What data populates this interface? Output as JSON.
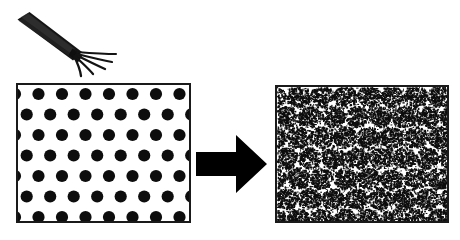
{
  "figure": {
    "background_color": "#ffffff",
    "width": 460,
    "height": 240
  },
  "tool": {
    "name": "rake-tool",
    "label": "mixing rake",
    "color": "#141414",
    "handle": {
      "angle_deg": 33,
      "length": 62,
      "thickness": 9
    },
    "tines": {
      "count": 5,
      "length": 42,
      "spread_deg": [
        12,
        26,
        40,
        54,
        68
      ]
    }
  },
  "arrow": {
    "name": "process-arrow",
    "direction": "right",
    "color": "#000000",
    "label": ""
  },
  "panels": [
    {
      "id": "ordered",
      "name": "ordered-particle-panel",
      "caption": "",
      "border_color": "#1a1a1a",
      "background_color": "#ffffff",
      "dot_color": "#0d0d0d",
      "pattern": "staggered-grid",
      "rows": 7,
      "cols": 8,
      "dot_radius": 6.1,
      "row_spacing": 20.5,
      "col_spacing": 23.5,
      "row_offset": 11.7,
      "first_row_y": 9,
      "first_col_x": -3
    },
    {
      "id": "dispersed",
      "name": "dispersed-particle-panel",
      "caption": "",
      "border_color": "#1a1a1a",
      "background_color": "#ffffff",
      "speck_color": "#0d0d0d",
      "pattern": "speckled-clusters",
      "cluster_rows": 7,
      "cluster_cols": 8,
      "cluster_spread": 11.5,
      "specks_per_cluster": 230,
      "speck_min_size": 0.7,
      "speck_max_size": 2.3,
      "background_speck_count": 2600,
      "seed": 20240917
    }
  ]
}
